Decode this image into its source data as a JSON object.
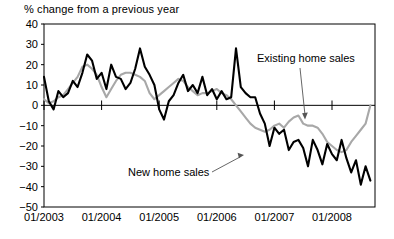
{
  "chart": {
    "title": "% change from a previous year",
    "series_labels": {
      "existing": "Existing home sales",
      "new": "New home sales"
    },
    "colors": {
      "existing_home_sales": "#a8a8a8",
      "new_home_sales": "#000000",
      "axis": "#000000",
      "background": "#ffffff"
    }
  },
  "chart_data": {
    "type": "line",
    "title": "% change from a previous year",
    "xlabel": "",
    "ylabel": "% change from a previous year",
    "ylim": [
      -50,
      40
    ],
    "yticks": [
      40,
      30,
      20,
      10,
      0,
      -10,
      -20,
      -30,
      -40,
      -50
    ],
    "ytick_labels": [
      "40",
      "30",
      "20",
      "10",
      "0",
      "−10",
      "−20",
      "−30",
      "−40",
      "−50"
    ],
    "xlim": [
      "01/2003",
      "09/2008"
    ],
    "xticks": [
      "01/2003",
      "01/2004",
      "01/2005",
      "01/2006",
      "01/2007",
      "01/2008"
    ],
    "xtick_labels": [
      "01/2003",
      "01/2004",
      "01/2005",
      "01/2006",
      "01/2007",
      "01/2008"
    ],
    "grid": false,
    "legend": "annotated-inline",
    "annotations": [
      {
        "text": "Existing home sales",
        "points_to": "existing home sales line near 01/2008",
        "arrow": "down-left"
      },
      {
        "text": "New home sales",
        "points_to": "new home sales line mid 2006",
        "arrow": "up-right"
      }
    ],
    "x": [
      "01/2003",
      "02/2003",
      "03/2003",
      "04/2003",
      "05/2003",
      "06/2003",
      "07/2003",
      "08/2003",
      "09/2003",
      "10/2003",
      "11/2003",
      "12/2003",
      "01/2004",
      "02/2004",
      "03/2004",
      "04/2004",
      "05/2004",
      "06/2004",
      "07/2004",
      "08/2004",
      "09/2004",
      "10/2004",
      "11/2004",
      "12/2004",
      "01/2005",
      "02/2005",
      "03/2005",
      "04/2005",
      "05/2005",
      "06/2005",
      "07/2005",
      "08/2005",
      "09/2005",
      "10/2005",
      "11/2005",
      "12/2005",
      "01/2006",
      "02/2006",
      "03/2006",
      "04/2006",
      "05/2006",
      "06/2006",
      "07/2006",
      "08/2006",
      "09/2006",
      "10/2006",
      "11/2006",
      "12/2006",
      "01/2007",
      "02/2007",
      "03/2007",
      "04/2007",
      "05/2007",
      "06/2007",
      "07/2007",
      "08/2007",
      "09/2007",
      "10/2007",
      "11/2007",
      "12/2007",
      "01/2008",
      "02/2008",
      "03/2008",
      "04/2008",
      "05/2008",
      "06/2008",
      "07/2008",
      "08/2008",
      "09/2008"
    ],
    "series": [
      {
        "name": "New home sales",
        "color": "#000000",
        "values": [
          14,
          2,
          -2,
          7,
          4,
          6,
          12,
          9,
          16,
          25,
          22,
          13,
          16,
          8,
          20,
          14,
          13,
          8,
          11,
          18,
          28,
          19,
          15,
          10,
          -2,
          -7,
          2,
          5,
          11,
          15,
          7,
          10,
          6,
          14,
          5,
          8,
          3,
          7,
          3,
          4,
          28,
          9,
          6,
          4,
          4,
          -4,
          -9,
          -20,
          -11,
          -14,
          -12,
          -22,
          -18,
          -17,
          -21,
          -30,
          -17,
          -22,
          -29,
          -19,
          -24,
          -27,
          -17,
          -26,
          -33,
          -27,
          -39,
          -30,
          -37
        ]
      },
      {
        "name": "Existing home sales",
        "color": "#a8a8a8",
        "values": [
          3,
          1,
          2,
          4,
          5,
          8,
          11,
          14,
          19,
          20,
          18,
          15,
          9,
          4,
          8,
          12,
          15,
          16,
          16,
          15,
          14,
          12,
          6,
          3,
          5,
          7,
          9,
          11,
          13,
          12,
          9,
          7,
          5,
          6,
          6,
          7,
          8,
          6,
          5,
          3,
          0,
          -3,
          -6,
          -9,
          -11,
          -12,
          -13,
          -12,
          -10,
          -9,
          -11,
          -8,
          -6,
          -5,
          -9,
          -10,
          -10,
          -11,
          -14,
          -18,
          -20,
          -22,
          -23,
          -22,
          -18,
          -15,
          -12,
          -9,
          0
        ]
      }
    ]
  }
}
